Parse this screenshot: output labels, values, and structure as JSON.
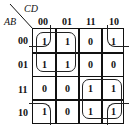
{
  "kmap": {
    "row_variable": "AB",
    "col_variable": "CD",
    "col_headers": [
      "00",
      "01",
      "11",
      "10"
    ],
    "row_headers": [
      "00",
      "01",
      "11",
      "10"
    ],
    "cells": [
      [
        "1",
        "1",
        "0",
        "1"
      ],
      [
        "1",
        "1",
        "0",
        "0"
      ],
      [
        "0",
        "0",
        "1",
        "1"
      ],
      [
        "1",
        "0",
        "1",
        "1"
      ]
    ],
    "groups": [
      {
        "name": "top-left-quad",
        "rows": [
          "00",
          "01"
        ],
        "cols": [
          "00",
          "01"
        ]
      },
      {
        "name": "bottom-right-quad",
        "rows": [
          "11",
          "10"
        ],
        "cols": [
          "11",
          "10"
        ]
      },
      {
        "name": "four-corners",
        "rows": [
          "00",
          "10"
        ],
        "cols": [
          "00",
          "10"
        ]
      }
    ]
  }
}
